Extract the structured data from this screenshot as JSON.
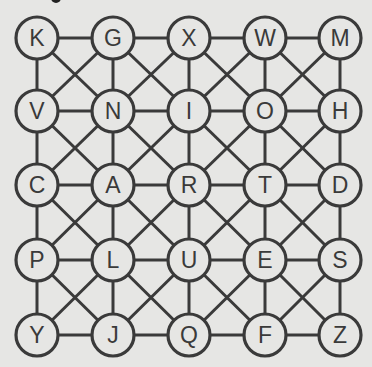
{
  "puzzle": {
    "type": "letter-grid-graph",
    "rows": 5,
    "cols": 5,
    "grid": [
      [
        "K",
        "G",
        "X",
        "W",
        "M"
      ],
      [
        "V",
        "N",
        "I",
        "O",
        "H"
      ],
      [
        "C",
        "A",
        "R",
        "T",
        "D"
      ],
      [
        "P",
        "L",
        "U",
        "E",
        "S"
      ],
      [
        "Y",
        "J",
        "Q",
        "F",
        "Z"
      ]
    ],
    "connections": "orthogonal neighbors plus diagonals inside each cell",
    "colors": {
      "background": "#e6e6e4",
      "line": "#3a3a3a",
      "node_fill": "#e6e6e4",
      "text": "#3a3a3a"
    }
  }
}
